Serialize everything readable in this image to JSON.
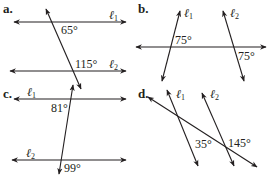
{
  "diagram": {
    "line_color": "#231f20",
    "panels": [
      {
        "id": "a",
        "label": "a.",
        "lines": [
          {
            "name": "ℓ1",
            "label_main": "ℓ",
            "label_sub": "1"
          },
          {
            "name": "ℓ2",
            "label_main": "ℓ",
            "label_sub": "2"
          }
        ],
        "angles": [
          "65°",
          "115°"
        ]
      },
      {
        "id": "b",
        "label": "b.",
        "lines": [
          {
            "name": "ℓ1",
            "label_main": "ℓ",
            "label_sub": "1"
          },
          {
            "name": "ℓ2",
            "label_main": "ℓ",
            "label_sub": "2"
          }
        ],
        "angles": [
          "75°",
          "75°"
        ]
      },
      {
        "id": "c",
        "label": "c.",
        "lines": [
          {
            "name": "ℓ1",
            "label_main": "ℓ",
            "label_sub": "1"
          },
          {
            "name": "ℓ2",
            "label_main": "ℓ",
            "label_sub": "2"
          }
        ],
        "angles": [
          "81°",
          "99°"
        ]
      },
      {
        "id": "d",
        "label": "d.",
        "lines": [
          {
            "name": "ℓ1",
            "label_main": "ℓ",
            "label_sub": "1"
          },
          {
            "name": "ℓ2",
            "label_main": "ℓ",
            "label_sub": "2"
          }
        ],
        "angles": [
          "35°",
          "145°"
        ]
      }
    ]
  }
}
